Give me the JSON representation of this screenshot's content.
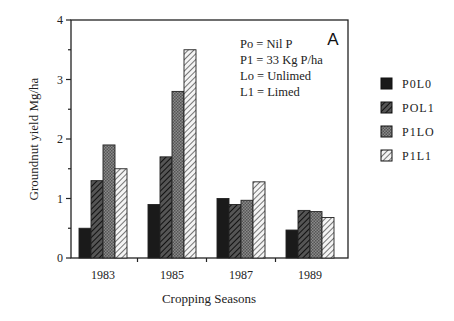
{
  "chart_data": {
    "type": "bar",
    "title": "",
    "panel_label": "A",
    "xlabel": "Cropping Seasons",
    "ylabel": "Groundnut yield Mg/ha",
    "ylim": [
      0,
      4
    ],
    "yticks": [
      0,
      1,
      2,
      3,
      4
    ],
    "grid": false,
    "legend_position": "right",
    "categories": [
      "1983",
      "1985",
      "1987",
      "1989"
    ],
    "series": [
      {
        "name": "P0L0",
        "pattern": "solid-black",
        "values": [
          0.5,
          0.9,
          1.0,
          0.47
        ]
      },
      {
        "name": "POL1",
        "pattern": "dark-diagonal-hatch",
        "values": [
          1.3,
          1.7,
          0.9,
          0.8
        ]
      },
      {
        "name": "P1LO",
        "pattern": "gray-crosshatch",
        "values": [
          1.9,
          2.8,
          0.97,
          0.78
        ]
      },
      {
        "name": "P1L1",
        "pattern": "light-diagonal-hatch",
        "values": [
          1.5,
          3.5,
          1.28,
          0.68
        ]
      }
    ],
    "annotations": [
      "Po = Nil P",
      "P1 = 33 Kg P/ha",
      "Lo = Unlimed",
      "L1 = Limed"
    ]
  }
}
